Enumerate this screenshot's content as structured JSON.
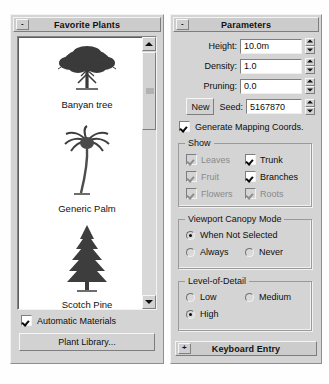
{
  "left_panel": {
    "rollout": {
      "title": "Favorite Plants",
      "toggle": "-"
    },
    "plants": [
      {
        "name": "Banyan tree",
        "icon": "broadleaf-tree-icon"
      },
      {
        "name": "Generic Palm",
        "icon": "palm-tree-icon"
      },
      {
        "name": "Scotch Pine",
        "icon": "conifer-tree-icon"
      }
    ],
    "scrollbar": {
      "up": "scroll-up-icon",
      "down": "scroll-down-icon"
    },
    "automatic_materials": {
      "label": "Automatic Materials",
      "checked": true
    },
    "plant_library_button": "Plant Library..."
  },
  "right_panel": {
    "rollout": {
      "title": "Parameters",
      "toggle": "-"
    },
    "fields": [
      {
        "label": "Height:",
        "value": "10.0m"
      },
      {
        "label": "Density:",
        "value": "1.0"
      },
      {
        "label": "Pruning:",
        "value": "0.0"
      }
    ],
    "seed_row": {
      "new_button": "New",
      "label": "Seed:",
      "value": "5167870"
    },
    "generate_mapping": {
      "label": "Generate Mapping Coords.",
      "checked": true
    },
    "show_group": {
      "title": "Show",
      "items": [
        {
          "label": "Leaves",
          "checked": true,
          "enabled": false
        },
        {
          "label": "Trunk",
          "checked": true,
          "enabled": true
        },
        {
          "label": "Fruit",
          "checked": true,
          "enabled": false
        },
        {
          "label": "Branches",
          "checked": true,
          "enabled": true
        },
        {
          "label": "Flowers",
          "checked": true,
          "enabled": false
        },
        {
          "label": "Roots",
          "checked": true,
          "enabled": false
        }
      ]
    },
    "canopy_group": {
      "title": "Viewport Canopy Mode",
      "options": [
        {
          "label": "When Not Selected",
          "selected": true
        },
        {
          "label": "Always",
          "selected": false
        },
        {
          "label": "Never",
          "selected": false
        }
      ]
    },
    "lod_group": {
      "title": "Level-of-Detail",
      "options": [
        {
          "label": "Low",
          "selected": false
        },
        {
          "label": "Medium",
          "selected": false
        },
        {
          "label": "High",
          "selected": true
        }
      ]
    },
    "keyboard_entry": {
      "title": "Keyboard Entry",
      "toggle": "+"
    }
  }
}
